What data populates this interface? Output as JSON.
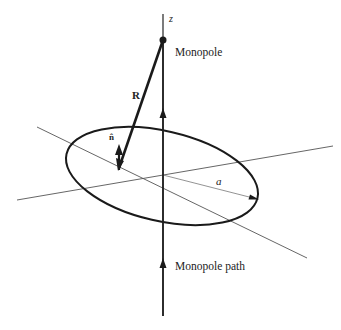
{
  "diagram": {
    "type": "3D geometry: magnetic monopole passing through a circular loop",
    "labels": {
      "z_axis": "z",
      "monopole": "Monopole",
      "position_vector": "R",
      "normal_vector": "n̂",
      "radius": "a",
      "monopole_path": "Monopole path"
    },
    "elements": {
      "z_axis": {
        "description": "vertical axis with upward arrows marking the monopole path"
      },
      "monopole": {
        "description": "filled dot on the z-axis above the loop"
      },
      "loop": {
        "description": "circular current loop of radius a, drawn in perspective as an ellipse centered on the z-axis"
      },
      "R_vector": {
        "description": "bold line from the monopole to a point on the loop"
      },
      "n_hat_vector": {
        "description": "unit normal arrow pointing upward from the point on the loop"
      },
      "radius_arrow": {
        "description": "thin arrow from loop center to the loop edge, labeled a"
      },
      "axis_lines": {
        "description": "two thin in-plane axis lines crossing at the loop center"
      }
    },
    "colors": {
      "stroke": "#1a1a1a",
      "thin_axis": "#555555",
      "background": "#ffffff"
    }
  }
}
